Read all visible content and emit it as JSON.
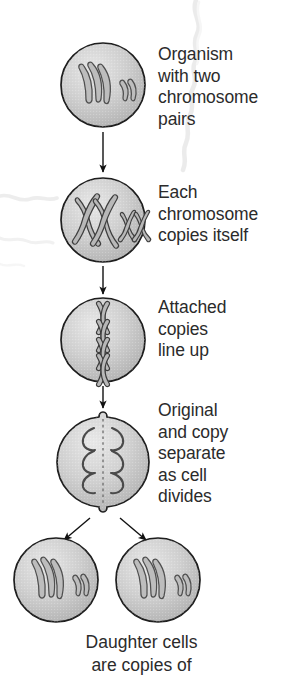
{
  "diagram": {
    "colors": {
      "cell_fill": "#c9c9c9",
      "cell_fill_light": "#e2e2e2",
      "cell_outline": "#1d1d1d",
      "chromosome_outline": "#4a4a4a",
      "chromosome_fill": "#b4b4b4",
      "arrow": "#111111",
      "text": "#2b2b2b",
      "background": "#ffffff",
      "torn_edge": "#d8d8d8"
    },
    "stages": [
      {
        "id": "stage-organism",
        "label_lines": [
          "Organism",
          "with two",
          "chromosome",
          "pairs"
        ],
        "cell": {
          "cx": 103,
          "cy": 85,
          "r": 42
        },
        "chromosome_state": "single-unduplicated",
        "chromosome_count": 4
      },
      {
        "id": "stage-copy",
        "label_lines": [
          "Each",
          "chromosome",
          "copies itself"
        ],
        "cell": {
          "cx": 103,
          "cy": 220,
          "r": 42
        },
        "chromosome_state": "duplicated-x-shaped",
        "chromosome_count": 4
      },
      {
        "id": "stage-lineup",
        "label_lines": [
          "Attached",
          "copies",
          "line up"
        ],
        "cell": {
          "cx": 103,
          "cy": 340,
          "r": 42
        },
        "chromosome_state": "aligned-at-equator",
        "chromosome_count": 4
      },
      {
        "id": "stage-separate",
        "label_lines": [
          "Original",
          "and copy",
          "separate",
          "as cell",
          "divides"
        ],
        "cell": {
          "cx": 103,
          "cy": 462,
          "r": 50
        },
        "chromosome_state": "separating-to-poles",
        "chromosome_count": 8,
        "has_cleavage_furrow": true
      }
    ],
    "daughter_cells": [
      {
        "id": "daughter-cell-left",
        "cx": 56,
        "cy": 580,
        "r": 42,
        "chromosome_count": 4
      },
      {
        "id": "daughter-cell-right",
        "cx": 158,
        "cy": 580,
        "r": 42,
        "chromosome_count": 4
      }
    ],
    "arrows": [
      {
        "id": "arrow-1",
        "from": "stage-organism",
        "to": "stage-copy",
        "x1": 103,
        "y1": 132,
        "x2": 103,
        "y2": 172
      },
      {
        "id": "arrow-2",
        "from": "stage-copy",
        "to": "stage-lineup",
        "x1": 103,
        "y1": 266,
        "x2": 103,
        "y2": 294
      },
      {
        "id": "arrow-3",
        "from": "stage-lineup",
        "to": "stage-separate",
        "x1": 103,
        "y1": 386,
        "x2": 103,
        "y2": 408
      },
      {
        "id": "arrow-4-left",
        "from": "stage-separate",
        "to": "daughter-cell-left",
        "x1": 90,
        "y1": 518,
        "x2": 64,
        "y2": 540
      },
      {
        "id": "arrow-4-right",
        "from": "stage-separate",
        "to": "daughter-cell-right",
        "x1": 120,
        "y1": 518,
        "x2": 146,
        "y2": 540
      }
    ],
    "caption_lines": [
      "Daughter cells",
      "are copies of"
    ]
  }
}
